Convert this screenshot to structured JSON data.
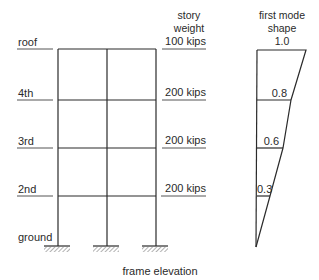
{
  "diagram": {
    "caption": "frame elevation",
    "floors": [
      {
        "label": "roof",
        "y": 49
      },
      {
        "label": "4th",
        "y": 100
      },
      {
        "label": "3rd",
        "y": 148
      },
      {
        "label": "2nd",
        "y": 196
      },
      {
        "label": "ground",
        "y": 246
      }
    ],
    "story_weight_header": [
      "story",
      "weight"
    ],
    "story_weights": [
      "100 kips",
      "200 kips",
      "200 kips",
      "200 kips"
    ],
    "mode_shape_header": [
      "first mode",
      "shape"
    ],
    "mode_shape_values": [
      "1.0",
      "0.8",
      "0.6",
      "0.3"
    ],
    "colors": {
      "line": "#2b2b2b",
      "text": "#2a2a2a",
      "hatch": "#555555"
    }
  }
}
